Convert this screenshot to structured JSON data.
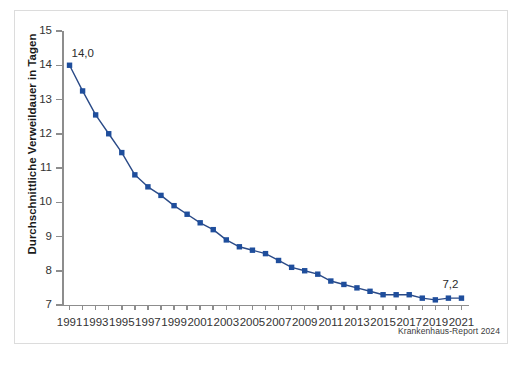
{
  "figure": {
    "source_note": "Krankenhaus-Report 2024",
    "accent_color": "#1f4e9c",
    "axis_color": "#8d8d8d",
    "frame_color": "#dcdcdc"
  },
  "chart_data": {
    "type": "line",
    "title": "",
    "subtitle": "",
    "xlabel": "",
    "ylabel": "Durchschnittliche Verweildauer in Tagen",
    "xlim": [
      1990.5,
      2021.5
    ],
    "ylim": [
      7,
      15
    ],
    "grid": false,
    "legend": null,
    "y_ticks": [
      7,
      8,
      9,
      10,
      11,
      12,
      13,
      14,
      15
    ],
    "y_tick_labels": [
      "7",
      "8",
      "9",
      "10",
      "11",
      "12",
      "13",
      "14",
      "15"
    ],
    "x_ticks": [
      1991,
      1992,
      1993,
      1994,
      1995,
      1996,
      1997,
      1998,
      1999,
      2000,
      2001,
      2002,
      2003,
      2004,
      2005,
      2006,
      2007,
      2008,
      2009,
      2010,
      2011,
      2012,
      2013,
      2014,
      2015,
      2016,
      2017,
      2018,
      2019,
      2020,
      2021
    ],
    "x_tick_labels": [
      "1991",
      "",
      "1993",
      "",
      "1995",
      "",
      "1997",
      "",
      "1999",
      "",
      "2001",
      "",
      "2003",
      "",
      "2005",
      "",
      "2007",
      "",
      "2009",
      "",
      "2011",
      "",
      "2013",
      "",
      "2015",
      "",
      "2017",
      "",
      "2019",
      "",
      "2021"
    ],
    "x": [
      1991,
      1992,
      1993,
      1994,
      1995,
      1996,
      1997,
      1998,
      1999,
      2000,
      2001,
      2002,
      2003,
      2004,
      2005,
      2006,
      2007,
      2008,
      2009,
      2010,
      2011,
      2012,
      2013,
      2014,
      2015,
      2016,
      2017,
      2018,
      2019,
      2020,
      2021
    ],
    "values": [
      14.0,
      13.25,
      12.55,
      12.0,
      11.45,
      10.8,
      10.45,
      10.2,
      9.9,
      9.65,
      9.4,
      9.2,
      8.9,
      8.7,
      8.6,
      8.5,
      8.3,
      8.1,
      8.0,
      7.9,
      7.7,
      7.6,
      7.5,
      7.4,
      7.3,
      7.3,
      7.3,
      7.2,
      7.15,
      7.2,
      7.2
    ],
    "point_labels": [
      {
        "x": 1991,
        "value": 14.0,
        "text": "14,0"
      },
      {
        "x": 2021,
        "value": 7.2,
        "text": "7,2"
      }
    ],
    "series": [
      {
        "name": "Durchschnittliche Verweildauer in Tagen",
        "color": "#1f4e9c",
        "marker": "square",
        "values": [
          14.0,
          13.25,
          12.55,
          12.0,
          11.45,
          10.8,
          10.45,
          10.2,
          9.9,
          9.65,
          9.4,
          9.2,
          8.9,
          8.7,
          8.6,
          8.5,
          8.3,
          8.1,
          8.0,
          7.9,
          7.7,
          7.6,
          7.5,
          7.4,
          7.3,
          7.3,
          7.3,
          7.2,
          7.15,
          7.2,
          7.2
        ]
      }
    ]
  }
}
